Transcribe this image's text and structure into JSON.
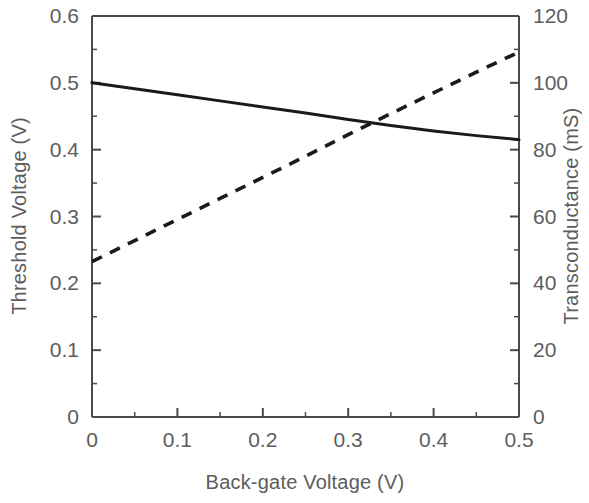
{
  "chart_data": {
    "type": "line",
    "title": "",
    "xlabel": "Back-gate Voltage (V)",
    "ylabel": "Threshold  Voltage (V)",
    "y2label": "Transconductance  (mS)",
    "xlim": [
      0,
      0.5
    ],
    "ylim": [
      0,
      0.6
    ],
    "y2lim": [
      0,
      120
    ],
    "grid": false,
    "legend": "none",
    "x_ticks": [
      "0",
      "0.1",
      "0.2",
      "0.3",
      "0.4",
      "0.5"
    ],
    "x_tick_values": [
      0,
      0.1,
      0.2,
      0.3,
      0.4,
      0.5
    ],
    "x_minor_step": 0.05,
    "y_ticks": [
      "0",
      "0.1",
      "0.2",
      "0.3",
      "0.4",
      "0.5",
      "0.6"
    ],
    "y_tick_values": [
      0,
      0.1,
      0.2,
      0.3,
      0.4,
      0.5,
      0.6
    ],
    "y_minor_step": 0.05,
    "y2_ticks": [
      "0",
      "20",
      "40",
      "60",
      "80",
      "100",
      "120"
    ],
    "y2_tick_values": [
      0,
      20,
      40,
      60,
      80,
      100,
      120
    ],
    "y2_minor_step": 10,
    "series": [
      {
        "name": "Threshold Voltage",
        "axis": "left",
        "style": "solid",
        "color": "#1a1a1a",
        "x": [
          0.0,
          0.05,
          0.1,
          0.15,
          0.2,
          0.25,
          0.3,
          0.35,
          0.4,
          0.45,
          0.5
        ],
        "values": [
          0.5,
          0.491,
          0.482,
          0.473,
          0.464,
          0.455,
          0.445,
          0.436,
          0.428,
          0.421,
          0.415
        ]
      },
      {
        "name": "Transconductance",
        "axis": "right",
        "style": "dashed",
        "color": "#1a1a1a",
        "x": [
          0.0,
          0.05,
          0.1,
          0.15,
          0.2,
          0.25,
          0.3,
          0.35,
          0.4,
          0.45,
          0.5
        ],
        "values": [
          46.5,
          52.8,
          59.1,
          65.4,
          71.7,
          78.0,
          84.5,
          90.8,
          97.0,
          103.2,
          109.2
        ]
      }
    ],
    "annotations": [
      {
        "note": "curves intersect near x = 0.31 V, left axis 0.44 V, right axis 88 mS"
      }
    ]
  }
}
